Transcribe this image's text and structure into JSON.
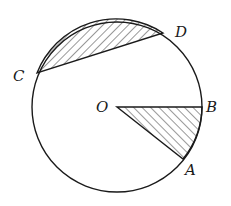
{
  "diagram": {
    "type": "circle-geometry",
    "circle": {
      "center_label": "O",
      "cx": 117,
      "cy": 107,
      "r": 85
    },
    "points": {
      "O": {
        "label": "O",
        "x": 117,
        "y": 107
      },
      "A": {
        "label": "A",
        "x": 183,
        "y": 159
      },
      "B": {
        "label": "B",
        "x": 202,
        "y": 107
      },
      "C": {
        "label": "C",
        "x": 37,
        "y": 73
      },
      "D": {
        "label": "D",
        "x": 163,
        "y": 33
      }
    },
    "shaded_regions": [
      {
        "name": "segment-CD",
        "description": "circular segment bounded by chord CD and minor arc CD"
      },
      {
        "name": "sector-AOB",
        "description": "sector bounded by radii OA, OB and arc AB"
      }
    ],
    "colors": {
      "stroke": "#1a1a1a",
      "background": "#ffffff",
      "hatch": "#333333"
    }
  }
}
